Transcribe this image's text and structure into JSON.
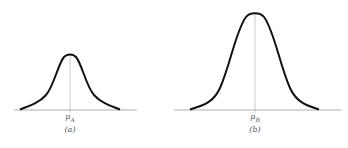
{
  "figure": {
    "panels": [
      {
        "id": "a",
        "mean_label": "μ",
        "mean_subscript": "A",
        "caption": "(a)",
        "peak_height_relative": 0.58,
        "spread_relative": "narrow"
      },
      {
        "id": "b",
        "mean_label": "μ",
        "mean_subscript": "B",
        "caption": "(b)",
        "peak_height_relative": 1.0,
        "spread_relative": "wider"
      }
    ],
    "colors": {
      "curve": "#111111",
      "axis": "#999999",
      "mean_line": "#aaaaaa",
      "label": "#555555"
    }
  }
}
